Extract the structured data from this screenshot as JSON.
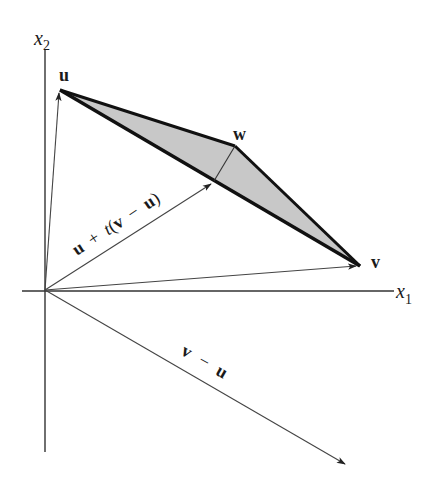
{
  "figure": {
    "type": "vector-geometry-diagram",
    "axes": {
      "horizontal_label": "x",
      "horizontal_subscript": "1",
      "vertical_label": "x",
      "vertical_subscript": "2"
    },
    "points": {
      "u": {
        "label": "u",
        "pixel": [
          60,
          90
        ]
      },
      "w": {
        "label": "w",
        "pixel": [
          235,
          146
        ]
      },
      "v": {
        "label": "v",
        "pixel": [
          360,
          266
        ]
      },
      "p": {
        "label": "u + t(v − u)",
        "pixel": [
          214,
          183
        ]
      }
    },
    "origin_pixel": [
      45,
      290
    ],
    "vectors": [
      {
        "name": "u",
        "from": "origin",
        "to": "u"
      },
      {
        "name": "v",
        "from": "origin",
        "to": "v"
      },
      {
        "name": "u + t(v − u)",
        "from": "origin",
        "to": "p"
      },
      {
        "name": "v − u",
        "from": "origin",
        "to": [
          345,
          465
        ]
      }
    ],
    "labels": {
      "u": "u",
      "w": "w",
      "v": "v",
      "combo_u": "u",
      "combo_plus": "+",
      "combo_t": "t",
      "combo_open": "(",
      "combo_v": "v",
      "combo_minus": "−",
      "combo_u2": "u",
      "combo_close": ")",
      "diff_v": "v",
      "diff_minus": "−",
      "diff_u": "u"
    },
    "colors": {
      "shade": "#c8c8c8",
      "edge": "#111111",
      "axis": "#333333",
      "vector": "#444444"
    }
  }
}
